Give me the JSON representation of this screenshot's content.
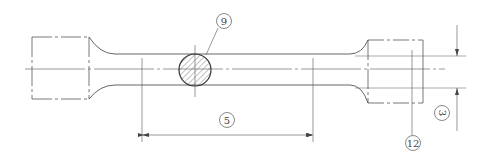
{
  "drawing": {
    "title": "Tensile test specimen (round bar)",
    "colors": {
      "line": "#555555",
      "background": "#ffffff",
      "hatch": "#666666"
    },
    "callouts": [
      {
        "id": "label-9",
        "text": "9",
        "x": 224,
        "y": 21
      },
      {
        "id": "label-5",
        "text": "5",
        "x": 227,
        "y": 120
      },
      {
        "id": "label-3",
        "text": "3",
        "x": 442,
        "y": 113,
        "rotated": true
      },
      {
        "id": "label-12",
        "text": "12",
        "x": 413,
        "y": 143
      }
    ]
  }
}
